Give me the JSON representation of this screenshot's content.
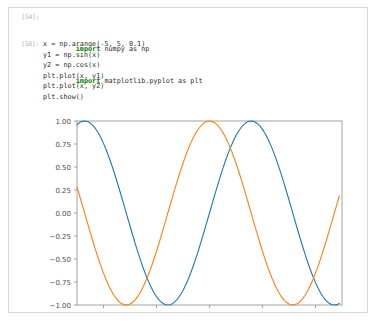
{
  "notebook": {
    "cells": [
      {
        "prompt": "[54]:",
        "lines": [
          {
            "kw": "import",
            "rest": " numpy as np"
          },
          {
            "kw": "import",
            "rest": " matplotlib.pyplot as plt"
          }
        ]
      },
      {
        "prompt": "[58]:",
        "code": "x = np.arange(-5, 5, 0.1)\ny1 = np.sin(x)\ny2 = np.cos(x)\nplt.plot(x, y1)\nplt.plot(x, y2)\nplt.show()"
      }
    ]
  },
  "chart_data": {
    "type": "line",
    "title": "",
    "xlabel": "",
    "ylabel": "",
    "xlim": [
      -5,
      5
    ],
    "ylim": [
      -1.0,
      1.0
    ],
    "xticks": [
      "-4",
      "-2",
      "0",
      "2",
      "4"
    ],
    "xtick_values": [
      -4,
      -2,
      0,
      2,
      4
    ],
    "yticks": [
      "1.00",
      "0.75",
      "0.50",
      "0.25",
      "0.00",
      "-0.25",
      "-0.50",
      "-0.75",
      "-1.00"
    ],
    "ytick_values": [
      1.0,
      0.75,
      0.5,
      0.25,
      0.0,
      -0.25,
      -0.5,
      -0.75,
      -1.0
    ],
    "grid": false,
    "legend": "none",
    "x_start": -5,
    "x_stop": 5,
    "x_step": 0.1,
    "series": [
      {
        "name": "y1 = np.sin(x)",
        "func": "sin",
        "color": "#1f77b4"
      },
      {
        "name": "y2 = np.cos(x)",
        "func": "cos",
        "color": "#ff7f0e"
      }
    ]
  }
}
